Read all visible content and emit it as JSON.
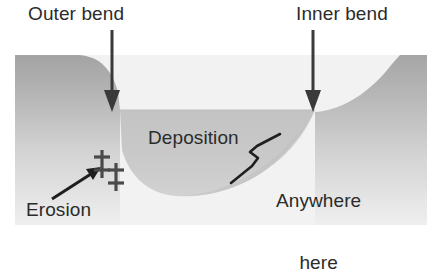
{
  "diagram": {
    "background_color": "#ffffff",
    "labels": {
      "outer_bend": "Outer bend",
      "inner_bend": "Inner bend",
      "deposition": "Deposition",
      "anywhere_line1": "Anywhere",
      "anywhere_line2": "here",
      "erosion": "Erosion"
    },
    "icons": {
      "erosion_mark_1": "double-dagger-icon",
      "erosion_mark_2": "double-dagger-icon",
      "outer_bend_arrow": "down-arrow-icon",
      "inner_bend_arrow": "down-arrow-icon",
      "erosion_arrow": "diagonal-arrow-icon",
      "deposition_bracket": "bracket-pointer-icon"
    },
    "colors": {
      "bank_top": "#a9a9a9",
      "bank_bottom": "#ededed",
      "channel_fill": "#c9c9c9",
      "floor": "#f1f1f1",
      "ink": "#2b2b2b",
      "sky": "#ffffff"
    },
    "erosion_marks": "‡‡"
  }
}
